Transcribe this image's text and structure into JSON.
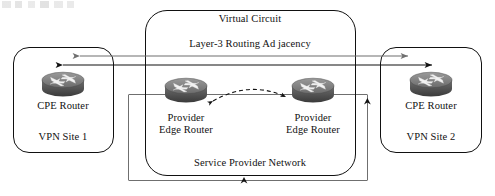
{
  "diagram": {
    "background": "#ffffff",
    "line_color": "#111111",
    "secondary_line_color": "#6f6f6f"
  },
  "cloud": {
    "top_label": "Virtual Circuit",
    "middle_label": "Layer-3 Routing Ad jacency",
    "bottom_label": "Service Provider Network"
  },
  "sites": [
    {
      "id": "vpn-site-1",
      "device_label": "CPE Router",
      "site_label": "VPN Site 1",
      "icon": "router-icon"
    },
    {
      "id": "vpn-site-2",
      "device_label": "CPE Router",
      "site_label": "VPN Site 2",
      "icon": "router-icon"
    }
  ],
  "provider_edges": [
    {
      "id": "pe-1",
      "line1": "Provider",
      "line2": "Edge Router",
      "icon": "router-icon"
    },
    {
      "id": "pe-2",
      "line1": "Provider",
      "line2": "Edge Router",
      "icon": "router-icon"
    }
  ],
  "connections": [
    {
      "id": "routing-adjacency-upper",
      "style": "solid",
      "color": "#6f6f6f",
      "arrowheads": "both"
    },
    {
      "id": "routing-adjacency-lower",
      "style": "solid",
      "color": "#111111",
      "arrowheads": "both"
    },
    {
      "id": "pe-to-pe-virtual-circuit",
      "style": "dashed-arc",
      "color": "#111111",
      "arrowheads": "both"
    },
    {
      "id": "service-provider-path",
      "style": "solid-rect",
      "color": "#6f6f6f",
      "arrowheads": "up"
    }
  ]
}
